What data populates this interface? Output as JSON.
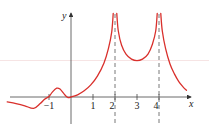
{
  "chart_data": {
    "type": "line",
    "title": "",
    "xlabel": "x",
    "ylabel": "y",
    "xlim": [
      -2.9,
      5.3
    ],
    "ylim": [
      -1.2,
      3.8
    ],
    "grid": false,
    "x_ticks": [
      {
        "value": -1,
        "label": "−1"
      },
      {
        "value": 1,
        "label": "1"
      },
      {
        "value": 2,
        "label": "2"
      },
      {
        "value": 3,
        "label": "3"
      },
      {
        "value": 4,
        "label": "4"
      }
    ],
    "vertical_asymptotes": [
      2,
      4
    ],
    "series": [
      {
        "name": "f(x)",
        "color": "#d9302c",
        "segments": [
          {
            "x": [
              -2.9,
              -2.5,
              -2.1,
              -1.7,
              -1.4,
              -1.2,
              -1.0,
              -0.85,
              -0.65,
              -0.5,
              -0.3,
              -0.15,
              0.0,
              0.3,
              0.6,
              0.9,
              1.2,
              1.5,
              1.7,
              1.85,
              1.92
            ],
            "y": [
              -0.22,
              -0.3,
              -0.4,
              -0.52,
              -0.3,
              -0.1,
              0.02,
              0.22,
              0.4,
              0.36,
              0.12,
              -0.02,
              0.0,
              0.1,
              0.28,
              0.55,
              0.95,
              1.55,
              2.2,
              2.95,
              3.8
            ]
          },
          {
            "x": [
              2.08,
              2.15,
              2.3,
              2.5,
              2.75,
              3.0,
              3.25,
              3.5,
              3.7,
              3.85,
              3.92
            ],
            "y": [
              3.8,
              3.0,
              2.35,
              1.95,
              1.72,
              1.65,
              1.72,
              1.95,
              2.4,
              3.0,
              3.8
            ]
          },
          {
            "x": [
              4.08,
              4.15,
              4.3,
              4.5,
              4.7,
              4.9,
              5.1,
              5.25
            ],
            "y": [
              3.8,
              3.0,
              2.2,
              1.5,
              1.05,
              0.7,
              0.45,
              0.3
            ]
          }
        ]
      }
    ]
  }
}
